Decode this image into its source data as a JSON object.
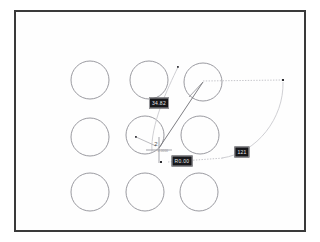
{
  "drawing": {
    "title": "CAD circle array with dimension annotations",
    "frame": {
      "x": 14,
      "y": 10,
      "width": 292,
      "height": 222,
      "border_color": "#3a3a3a",
      "background": "#fefefe"
    },
    "colors": {
      "circle_stroke": "#8f8f95",
      "construction_line": "#b9b9bf",
      "dimension_line": "#c3c3c8",
      "solid_leader": "#6e6e74",
      "crosshair": "#9b9ba1",
      "label_background": "#17171a",
      "label_text": "#e9e9ec",
      "label_border": "#9a9a9e",
      "node_point": "#3f3f44"
    }
  },
  "circle_array": {
    "rows": 3,
    "columns": 3,
    "radius": 19,
    "stroke_width": 0.9,
    "centers": [
      {
        "name": "circle-r1c1",
        "cx": 90,
        "cy": 80
      },
      {
        "name": "circle-r1c2",
        "cx": 149,
        "cy": 80
      },
      {
        "name": "circle-r1c3",
        "cx": 203,
        "cy": 82
      },
      {
        "name": "circle-r2c1",
        "cx": 90,
        "cy": 137
      },
      {
        "name": "circle-r2c2",
        "cx": 145,
        "cy": 135
      },
      {
        "name": "circle-r2c3",
        "cx": 200,
        "cy": 135
      },
      {
        "name": "circle-r3c1",
        "cx": 90,
        "cy": 192
      },
      {
        "name": "circle-r3c2",
        "cx": 145,
        "cy": 192
      },
      {
        "name": "circle-r3c3",
        "cx": 199,
        "cy": 192
      }
    ]
  },
  "dimension_labels": [
    {
      "name": "dimension-label-top",
      "text": "34.82",
      "x": 159,
      "y": 103
    },
    {
      "name": "dimension-label-mid",
      "text": "R0.00",
      "x": 182,
      "y": 161
    },
    {
      "name": "dimension-label-right",
      "text": "121",
      "x": 242,
      "y": 152
    }
  ],
  "annotations": {
    "cursor_tag": "2",
    "micro_text": "0.0000"
  },
  "geometry": {
    "nodes": [
      {
        "name": "node-top",
        "x": 178,
        "y": 67
      },
      {
        "name": "node-right",
        "x": 283,
        "y": 80
      },
      {
        "name": "node-mid-left",
        "x": 136,
        "y": 137
      },
      {
        "name": "node-bottom-left",
        "x": 161,
        "y": 162
      }
    ],
    "crosshair": {
      "x": 159,
      "y": 150,
      "size": 13
    },
    "leader_line": {
      "x1": 159,
      "y1": 147,
      "x2": 203,
      "y2": 82
    },
    "radial_line": {
      "x1": 203,
      "y1": 82,
      "x2": 189,
      "y2": 96
    },
    "mid_left_radial": {
      "x1": 136,
      "y1": 137,
      "x2": 155,
      "y2": 145
    },
    "dimension_line_horizontal": {
      "x1": 203,
      "y1": 81,
      "x2": 283,
      "y2": 80
    },
    "dimension_line_bottom": {
      "x1": 168,
      "y1": 162,
      "x2": 222,
      "y2": 158
    },
    "arc_left": {
      "d": "M 178 67 C 168 88, 150 125, 152 152"
    },
    "arc_right": {
      "d": "M 283 82 C 283 118, 258 152, 222 158"
    }
  }
}
